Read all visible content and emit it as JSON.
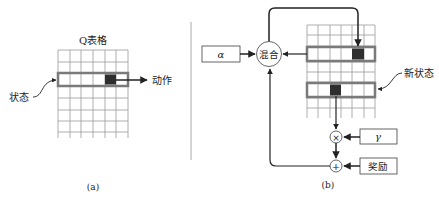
{
  "panel_a": {
    "caption": "(a)",
    "table_title": "Q表格",
    "state_label": "状态",
    "action_label": "动作",
    "grid": {
      "columns": 6,
      "rows": 7,
      "highlight_row": 2,
      "selected_col": 5
    }
  },
  "panel_b": {
    "caption": "(b)",
    "alpha_label": "α",
    "mix_label": "混合",
    "new_state_label": "新状态",
    "gamma_label": "γ",
    "reward_label": "奖励",
    "multiply_symbol": "×",
    "add_symbol": "+",
    "grid": {
      "columns": 6,
      "rows": 7,
      "current_row": 2,
      "current_col": 5,
      "next_row": 5,
      "next_col": 3
    }
  },
  "colors": {
    "line": "#222222",
    "grid_line": "#9a9a9a",
    "highlight_outline": "#7a7a7a",
    "selected_cell": "#2e2e2e",
    "divider": "#aaaaaa"
  }
}
